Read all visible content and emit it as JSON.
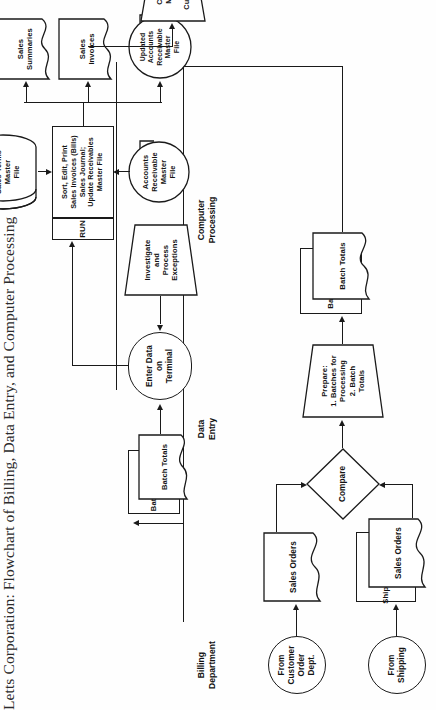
{
  "title": "Letts Corporation: Flowchart of Billing, Data Entry, and Computer Processing",
  "lanes": [
    {
      "id": "billing",
      "line1": "Billing",
      "line2": "Department"
    },
    {
      "id": "data_entry",
      "line1": "Data",
      "line2": "Entry"
    },
    {
      "id": "computer",
      "line1": "Computer",
      "line2": "Processing"
    }
  ],
  "nodes": {
    "from_customer_order": {
      "lines": [
        "From",
        "Customer",
        "Order",
        "Dept."
      ],
      "shape": "connector-circle"
    },
    "from_shipping": {
      "lines": [
        "From",
        "Shipping"
      ],
      "shape": "connector-circle"
    },
    "sales_orders_a": {
      "lines": [
        "Sales Orders"
      ],
      "shape": "document"
    },
    "shipping_document": {
      "lines": [
        "Shipping Document"
      ],
      "shape": "document"
    },
    "sales_orders_b": {
      "lines": [
        "Sales Orders"
      ],
      "shape": "document"
    },
    "compare": {
      "lines": [
        "Compare"
      ],
      "shape": "decision-diamond"
    },
    "prepare": {
      "lines": [
        "Prepare:",
        "1. Batches for",
        "Processing",
        "2. Batch",
        "Totals"
      ],
      "shape": "manual-operation"
    },
    "batched_order": {
      "lines": [
        "Batched Order"
      ],
      "shape": "document"
    },
    "batch_totals_billing": {
      "lines": [
        "Batch Totals"
      ],
      "shape": "document"
    },
    "batched_orders_de": {
      "lines": [
        "Batched Orders"
      ],
      "shape": "document"
    },
    "batch_totals_de": {
      "lines": [
        "Batch Totals"
      ],
      "shape": "document"
    },
    "enter_data": {
      "lines": [
        "Enter Data",
        "on",
        "Terminal"
      ],
      "shape": "manual-input-terminal"
    },
    "investigate": {
      "lines": [
        "Investigate",
        "and",
        "Process",
        "Exceptions"
      ],
      "shape": "manual-operation"
    },
    "run_tag": {
      "lines": [
        "RUN"
      ],
      "shape": "rectangle"
    },
    "run_process": {
      "lines": [
        "Sort, Edit, Print",
        "Sales Invoices (Bills)",
        "Sales Journal;",
        "Update Receivables",
        "Master File"
      ],
      "shape": "process-rectangle"
    },
    "ar_master_file": {
      "lines": [
        "Accounts",
        "Receivable",
        "Master",
        "File"
      ],
      "shape": "online-storage"
    },
    "price_terms_file": {
      "lines": [
        "Price and",
        "Sales Terms",
        "Master",
        "File"
      ],
      "shape": "disk-cylinder"
    },
    "updated_ar_file": {
      "lines": [
        "Updated",
        "Accounts",
        "Receivable",
        "Master",
        "File"
      ],
      "shape": "online-storage"
    },
    "sales_invoices": {
      "lines": [
        "Sales",
        "Invoices"
      ],
      "shape": "document"
    },
    "sales_summaries": {
      "lines": [
        "Sales",
        "Summaries"
      ],
      "shape": "document"
    },
    "exception_report": {
      "lines": [
        "Exception",
        "Report"
      ],
      "shape": "document"
    },
    "copies_mailed": {
      "lines": [
        "Copies",
        "Mailed",
        "to",
        "Customer"
      ],
      "shape": "manual-operation"
    }
  },
  "colors": {
    "stroke": "#1a1a1a",
    "fill": "#ffffff",
    "text": "#141414",
    "page": "#fefefe"
  }
}
